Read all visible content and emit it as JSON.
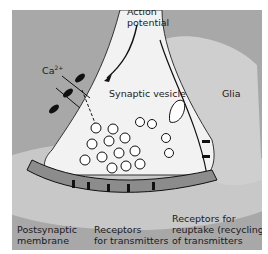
{
  "diagram": {
    "labels": {
      "action_potential": "Action\npotential",
      "calcium": "Ca",
      "calcium_sup": "2+",
      "synaptic_vesicle": "Synaptic vesicle",
      "glia": "Glia",
      "postsynaptic_membrane": "Postsynaptic\nmembrane",
      "receptors_transmitters": "Receptors\nfor transmitters",
      "receptors_reuptake": "Receptors for\nreuptake (recycling)\nof transmitters"
    },
    "colors": {
      "background": "#a8a8a8",
      "terminal": "#f2f2f2",
      "glia": "#c4c4c4",
      "cleft": "#8c8c8c",
      "postsynaptic_halo": "#d0d0d0",
      "ink": "#111111"
    }
  }
}
